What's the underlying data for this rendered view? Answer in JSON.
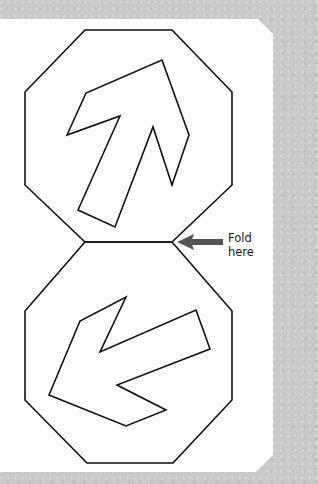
{
  "colors": {
    "background": "#c9c9c9",
    "paper": "#ffffff",
    "outline": "#111111",
    "fold_arrow": "#555555"
  },
  "paper": {
    "points": "0,19 258,19 273,34 273,455 256,472 0,472"
  },
  "top_octagon": {
    "points": "85,30 172,30 232,92 232,185 172,242 85,242 25,185 25,92"
  },
  "bottom_octagon": {
    "points": "85,242 172,242 232,311 232,400 173,463 87,463 25,400 25,311"
  },
  "top_arrow": {
    "direction": "up-right",
    "points": "162,60 189,135 172,185 153,127 115,227 78,210 120,116 67,135 86,93"
  },
  "bottom_arrow": {
    "direction": "down-left",
    "points": "126,297 100,352 196,310 210,349 117,385 166,410 126,426 49,395 80,321"
  },
  "fold_line": {
    "x1": 85,
    "y1": 242,
    "x2": 172,
    "y2": 242
  },
  "fold_indicator": {
    "label_line1": "Fold",
    "label_line2": "here",
    "arrow_icon": "left-arrow-icon"
  }
}
